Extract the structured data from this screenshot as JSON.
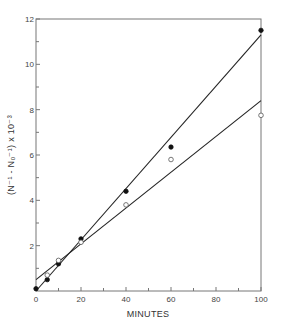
{
  "chart_data": {
    "type": "scatter",
    "title": "",
    "xlabel": "MINUTES",
    "ylabel": "(N⁻¹ - N₀⁻¹) x 10⁻³",
    "xlim": [
      0,
      100
    ],
    "ylim": [
      0,
      12
    ],
    "grid": false,
    "legend": null,
    "x_ticks": [
      0,
      20,
      40,
      60,
      80,
      100
    ],
    "x_tick_labels": [
      "0",
      "20",
      "40",
      "60",
      "80",
      "100"
    ],
    "x_minor_ticks": [
      10,
      30,
      50,
      70,
      90
    ],
    "y_ticks": [
      2,
      4,
      6,
      8,
      10,
      12
    ],
    "y_tick_labels": [
      "2",
      "4",
      "6",
      "8",
      "10",
      "12"
    ],
    "y_minor_ticks": [
      1,
      3,
      5,
      7,
      9,
      11
    ],
    "series": [
      {
        "name": "filled circles",
        "marker": "filled-circle",
        "x": [
          0,
          5,
          10,
          20,
          40,
          60,
          100
        ],
        "y": [
          0.1,
          0.5,
          1.2,
          2.3,
          4.4,
          6.35,
          11.5
        ],
        "fit_line": {
          "x": [
            0,
            100
          ],
          "y": [
            0.0,
            11.3
          ]
        }
      },
      {
        "name": "open circles",
        "marker": "open-circle",
        "x": [
          5,
          10,
          20,
          40,
          60,
          100
        ],
        "y": [
          0.7,
          1.35,
          2.15,
          3.8,
          5.8,
          7.75
        ],
        "fit_line": {
          "x": [
            0,
            100
          ],
          "y": [
            0.5,
            8.4
          ]
        }
      }
    ]
  }
}
